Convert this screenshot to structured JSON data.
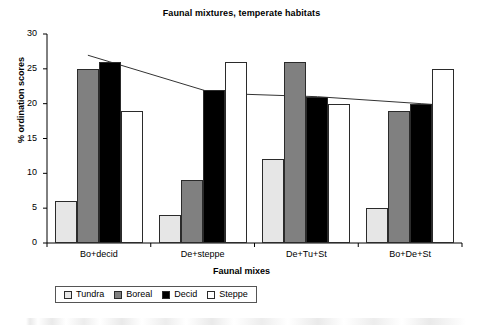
{
  "chart_data": {
    "type": "bar",
    "title": "Faunal mixtures, temperate habitats",
    "xlabel": "Faunal mixes",
    "ylabel": "% ordination scores",
    "categories": [
      "Bo+decid",
      "De+steppe",
      "De+Tu+St",
      "Bo+De+St"
    ],
    "ylim": [
      0,
      30
    ],
    "yticks": [
      0,
      5,
      10,
      15,
      20,
      25,
      30
    ],
    "grid": false,
    "legend_position": "bottom",
    "series": [
      {
        "name": "Tundra",
        "values": [
          6,
          4,
          12,
          5
        ],
        "color": "#e6e6e6"
      },
      {
        "name": "Boreal",
        "values": [
          25,
          9,
          26,
          19
        ],
        "color": "#808080"
      },
      {
        "name": "Decid",
        "values": [
          26,
          22,
          21,
          20
        ],
        "color": "#000000"
      },
      {
        "name": "Steppe",
        "values": [
          19,
          26,
          20,
          25
        ],
        "color": "#ffffff"
      }
    ],
    "trend_line": {
      "name": "trend",
      "values": [
        26,
        21.5,
        21,
        20
      ],
      "color": "#333333"
    }
  }
}
